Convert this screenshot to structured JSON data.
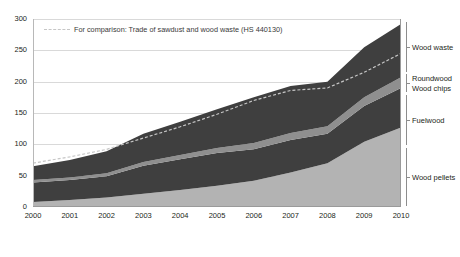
{
  "chart_data": {
    "type": "area",
    "title": "",
    "subtitle": "",
    "xlabel": "",
    "ylabel": "",
    "stacked": true,
    "grid": true,
    "legend_position": "inside-top-left",
    "x": [
      2000,
      2001,
      2002,
      2003,
      2004,
      2005,
      2006,
      2007,
      2008,
      2009,
      2010
    ],
    "categories": [
      "2000",
      "2001",
      "2002",
      "2003",
      "2004",
      "2005",
      "2006",
      "2007",
      "2008",
      "2009",
      "2010"
    ],
    "xlim": [
      2000,
      2010
    ],
    "ylim": [
      0,
      300
    ],
    "yticks": [
      0,
      50,
      100,
      150,
      200,
      250,
      300
    ],
    "xticks": [
      "2000",
      "2001",
      "2002",
      "2003",
      "2004",
      "2005",
      "2006",
      "2007",
      "2008",
      "2009",
      "2010"
    ],
    "series": [
      {
        "name": "Wood pellets",
        "color": "#b3b3b3",
        "values": [
          8,
          11,
          15,
          21,
          27,
          34,
          42,
          55,
          70,
          104,
          127
        ]
      },
      {
        "name": "Fuelwood",
        "color": "#3f3f3f",
        "values": [
          31,
          32,
          34,
          45,
          49,
          52,
          50,
          52,
          47,
          57,
          63
        ]
      },
      {
        "name": "Roundwood / Wood chips",
        "color": "#8f8f8f",
        "values": [
          4,
          4,
          5,
          6,
          7,
          8,
          10,
          11,
          12,
          14,
          17
        ]
      },
      {
        "name": "Wood waste",
        "color": "#3f3f3f",
        "values": [
          22,
          28,
          35,
          45,
          53,
          62,
          73,
          75,
          71,
          80,
          85
        ]
      }
    ],
    "stack_totals": [
      65,
      75,
      89,
      117,
      136,
      156,
      175,
      193,
      200,
      255,
      292
    ],
    "reference_line": {
      "name": "For comparison: Trade of sawdust and wood waste (HS 440130)",
      "style": "dashed",
      "color": "#c6c6c6",
      "values": [
        70,
        80,
        92,
        110,
        128,
        148,
        170,
        186,
        190,
        215,
        245
      ]
    }
  },
  "legend": {
    "reference_label": "For comparison: Trade of sawdust and wood waste (HS 440130)"
  },
  "right_labels": [
    {
      "label": "Wood waste"
    },
    {
      "label": "Roundwood"
    },
    {
      "label": "Wood chips"
    },
    {
      "label": "Fuelwood"
    },
    {
      "label": "Wood pellets"
    }
  ]
}
